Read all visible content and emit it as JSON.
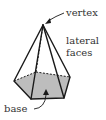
{
  "diagram": {
    "labels": {
      "vertex": "vertex",
      "lateral_line1": "lateral",
      "lateral_line2": "faces",
      "base": "base"
    },
    "colors": {
      "edge": "#1a1a1a",
      "base_fill": "#bdbdbd",
      "text": "#333333",
      "background": "#ffffff"
    },
    "geometry": {
      "apex": [
        43,
        25
      ],
      "base_vertices": [
        [
          14,
          81
        ],
        [
          36,
          72
        ],
        [
          70,
          77
        ],
        [
          64,
          98
        ],
        [
          31,
          99
        ]
      ],
      "hidden_vertex_index": 1
    }
  }
}
